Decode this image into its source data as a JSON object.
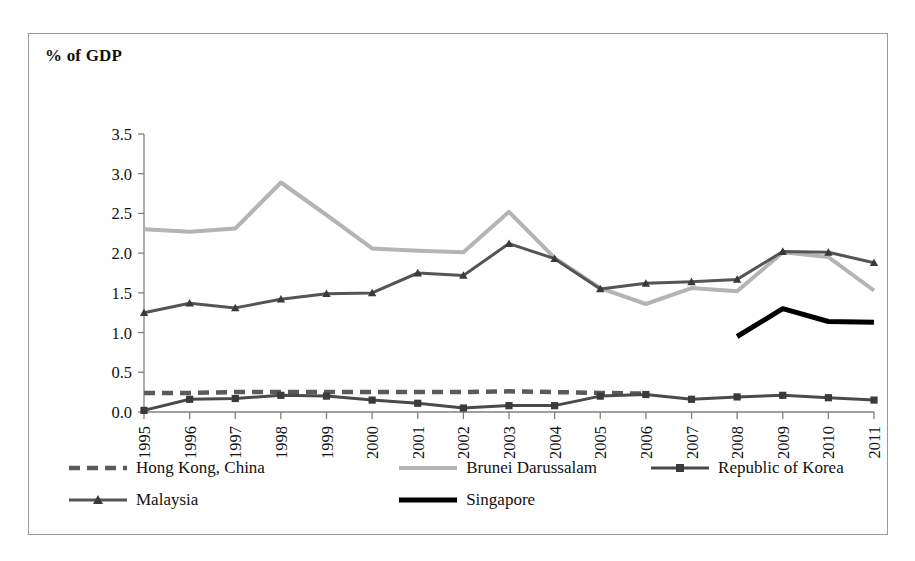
{
  "chart_data": {
    "type": "line",
    "title": "",
    "ylabel": "% of GDP",
    "xlabel": "",
    "ylim": [
      0.0,
      3.5
    ],
    "ytick_labels": [
      "0.0",
      "0.5",
      "1.0",
      "1.5",
      "2.0",
      "2.5",
      "3.0",
      "3.5"
    ],
    "ytick_values": [
      0.0,
      0.5,
      1.0,
      1.5,
      2.0,
      2.5,
      3.0,
      3.5
    ],
    "grid": false,
    "legend_position": "bottom",
    "categories": [
      "1995",
      "1996",
      "1997",
      "1998",
      "1999",
      "2000",
      "2001",
      "2002",
      "2003",
      "2004",
      "2005",
      "2006",
      "2007",
      "2008",
      "2009",
      "2010",
      "2011"
    ],
    "x": [
      1995,
      1996,
      1997,
      1998,
      1999,
      2000,
      2001,
      2002,
      2003,
      2004,
      2005,
      2006,
      2007,
      2008,
      2009,
      2010,
      2011
    ],
    "series": [
      {
        "name": "Hong Kong, China",
        "style": "dashed",
        "color": "#5a5a5a",
        "marker": "none",
        "values": [
          0.24,
          0.24,
          0.25,
          0.25,
          0.25,
          0.25,
          0.25,
          0.25,
          0.26,
          0.25,
          0.24,
          0.23,
          null,
          null,
          null,
          null,
          null
        ]
      },
      {
        "name": "Brunei Darussalam",
        "style": "solid",
        "color": "#b4b4b4",
        "marker": "none",
        "values": [
          2.3,
          2.27,
          2.31,
          2.89,
          2.48,
          2.06,
          2.03,
          2.01,
          2.52,
          1.94,
          1.56,
          1.36,
          1.56,
          1.52,
          2.01,
          1.95,
          1.53
        ]
      },
      {
        "name": "Republic of Korea",
        "style": "solid",
        "color": "#4a4a4a",
        "marker": "square",
        "values": [
          0.02,
          0.16,
          0.17,
          0.21,
          0.2,
          0.15,
          0.11,
          0.05,
          0.08,
          0.08,
          0.2,
          0.22,
          0.16,
          0.19,
          0.21,
          0.18,
          0.15
        ]
      },
      {
        "name": "Malaysia",
        "style": "solid",
        "color": "#555555",
        "marker": "triangle",
        "values": [
          1.25,
          1.37,
          1.31,
          1.42,
          1.49,
          1.5,
          1.75,
          1.72,
          2.12,
          1.93,
          1.55,
          1.62,
          1.64,
          1.67,
          2.02,
          2.01,
          1.88
        ]
      },
      {
        "name": "Singapore",
        "style": "solid-bold",
        "color": "#000000",
        "marker": "none",
        "values": [
          null,
          null,
          null,
          null,
          null,
          null,
          null,
          null,
          null,
          null,
          null,
          null,
          null,
          0.95,
          1.3,
          1.14,
          1.13
        ]
      }
    ]
  },
  "legend": {
    "rows": [
      [
        {
          "label": "Hong Kong, China",
          "swatch": "dashed-gray"
        },
        {
          "label": "Brunei Darussalam",
          "swatch": "solid-lightgray"
        },
        {
          "label": "Republic of Korea",
          "swatch": "solid-gray-square"
        }
      ],
      [
        {
          "label": "Malaysia",
          "swatch": "solid-gray-triangle"
        },
        {
          "label": "Singapore",
          "swatch": "solid-black-bold"
        }
      ]
    ]
  },
  "colors": {
    "brunei": "#b4b4b4",
    "korea": "#4a4a4a",
    "malaysia": "#555555",
    "hongkong": "#5a5a5a",
    "singapore": "#000000",
    "axis": "#808080",
    "border": "#9a9a9a",
    "text": "#111111"
  }
}
